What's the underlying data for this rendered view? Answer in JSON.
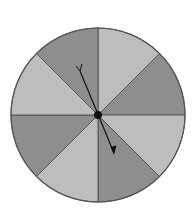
{
  "diagram": {
    "type": "spinner",
    "sector_count": 8,
    "sectors": [
      {
        "index": 0,
        "shade": "light"
      },
      {
        "index": 1,
        "shade": "dark"
      },
      {
        "index": 2,
        "shade": "light"
      },
      {
        "index": 3,
        "shade": "dark"
      },
      {
        "index": 4,
        "shade": "light"
      },
      {
        "index": 5,
        "shade": "dark"
      },
      {
        "index": 6,
        "shade": "light"
      },
      {
        "index": 7,
        "shade": "dark"
      }
    ],
    "colors": {
      "light": "#bdbdbd",
      "dark": "#8e8e8e",
      "border": "#555555",
      "pointer": "#111111"
    },
    "pointer_direction": "southeast"
  }
}
